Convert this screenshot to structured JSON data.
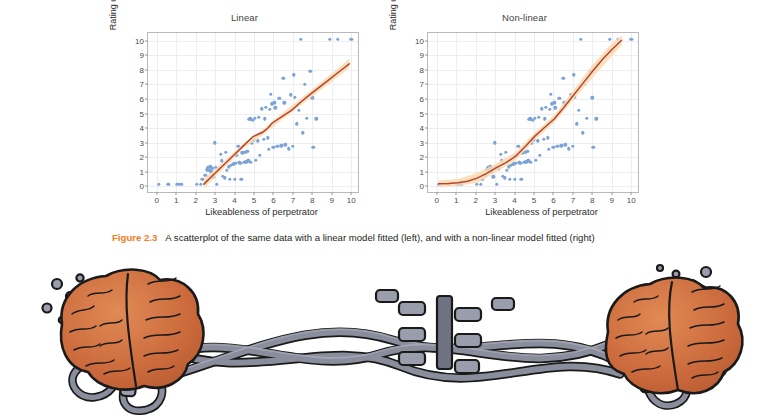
{
  "figure": {
    "number_label": "Figure 2.3",
    "caption": "A scatterplot of the same data with a linear model fitted (left), and with a non-linear model fitted (right)",
    "accent_color": "#f47b20"
  },
  "colors": {
    "point": "#7ba3d8",
    "fit_line": "#b5462a",
    "fit_band": "#fbd9b4",
    "grid": "#ededf2",
    "axis": "#b9b9b9",
    "text": "#2d2d2d",
    "brain": "#cc6b3d",
    "cable": "#8a8d9c",
    "outline": "#1a1a1a"
  },
  "chart_data": [
    {
      "type": "scatter",
      "title": "Linear",
      "xlabel": "Likeableness of perpetrator",
      "ylabel": "Rating of deed",
      "xlim": [
        -0.45,
        10.45
      ],
      "ylim": [
        -0.55,
        10.55
      ],
      "xticks": [
        0,
        1,
        2,
        3,
        4,
        5,
        6,
        7,
        8,
        9,
        10
      ],
      "yticks": [
        0,
        1,
        2,
        3,
        4,
        5,
        6,
        7,
        8,
        9,
        10
      ],
      "grid": true,
      "legend": "none",
      "fit_type": "linear",
      "fit_label": "linear model fitted",
      "fit_line": [
        [
          2.45,
          0.0
        ],
        [
          3.0,
          0.72
        ],
        [
          3.5,
          1.37
        ],
        [
          4.0,
          2.02
        ],
        [
          4.5,
          2.67
        ],
        [
          5.0,
          3.32
        ],
        [
          5.5,
          3.62
        ],
        [
          5.8,
          3.95
        ],
        [
          6.0,
          4.27
        ],
        [
          6.5,
          4.72
        ],
        [
          7.0,
          5.15
        ],
        [
          7.5,
          5.75
        ],
        [
          8.0,
          6.3
        ],
        [
          8.5,
          6.82
        ],
        [
          9.0,
          7.35
        ],
        [
          9.5,
          7.88
        ],
        [
          10.0,
          8.4
        ]
      ],
      "fit_band_upper": [
        [
          2.45,
          0.35
        ],
        [
          3.5,
          1.6
        ],
        [
          4.5,
          2.85
        ],
        [
          5.5,
          3.82
        ],
        [
          6.5,
          4.95
        ],
        [
          7.5,
          6.0
        ],
        [
          8.5,
          7.1
        ],
        [
          9.5,
          8.2
        ],
        [
          10.0,
          8.75
        ]
      ],
      "fit_band_lower": [
        [
          2.45,
          -0.3
        ],
        [
          3.5,
          1.12
        ],
        [
          4.5,
          2.5
        ],
        [
          5.5,
          3.42
        ],
        [
          6.5,
          4.5
        ],
        [
          7.5,
          5.52
        ],
        [
          8.5,
          6.55
        ],
        [
          9.5,
          7.58
        ],
        [
          10.0,
          8.1
        ]
      ],
      "points": [
        [
          0.1,
          0.0
        ],
        [
          0.6,
          0.0
        ],
        [
          1.05,
          0.0
        ],
        [
          1.2,
          0.0
        ],
        [
          1.3,
          0.0
        ],
        [
          2.05,
          0.0
        ],
        [
          2.25,
          0.0
        ],
        [
          2.35,
          0.35
        ],
        [
          2.5,
          0.6
        ],
        [
          2.6,
          1.0
        ],
        [
          2.62,
          1.15
        ],
        [
          2.7,
          0.95
        ],
        [
          2.75,
          1.2
        ],
        [
          2.8,
          0.85
        ],
        [
          2.85,
          1.1
        ],
        [
          2.9,
          0.5
        ],
        [
          3.0,
          2.85
        ],
        [
          3.05,
          1.15
        ],
        [
          3.1,
          0.0
        ],
        [
          3.2,
          1.05
        ],
        [
          3.3,
          2.05
        ],
        [
          3.35,
          1.6
        ],
        [
          3.4,
          0.55
        ],
        [
          3.5,
          0.45
        ],
        [
          3.55,
          2.2
        ],
        [
          3.6,
          0.95
        ],
        [
          3.7,
          1.2
        ],
        [
          3.75,
          0.35
        ],
        [
          3.8,
          1.3
        ],
        [
          3.9,
          1.35
        ],
        [
          3.95,
          1.4
        ],
        [
          4.0,
          0.35
        ],
        [
          4.05,
          1.45
        ],
        [
          4.1,
          2.0
        ],
        [
          4.2,
          2.6
        ],
        [
          4.25,
          1.5
        ],
        [
          4.3,
          1.42
        ],
        [
          4.35,
          0.35
        ],
        [
          4.4,
          2.15
        ],
        [
          4.5,
          1.5
        ],
        [
          4.55,
          2.2
        ],
        [
          4.6,
          1.55
        ],
        [
          4.65,
          2.25
        ],
        [
          4.7,
          1.6
        ],
        [
          4.75,
          4.45
        ],
        [
          4.8,
          4.5
        ],
        [
          4.85,
          1.5
        ],
        [
          4.9,
          2.8
        ],
        [
          4.95,
          4.4
        ],
        [
          5.0,
          3.05
        ],
        [
          5.05,
          4.55
        ],
        [
          5.1,
          1.65
        ],
        [
          5.2,
          3.0
        ],
        [
          5.25,
          4.6
        ],
        [
          5.3,
          2.0
        ],
        [
          5.4,
          5.2
        ],
        [
          5.5,
          3.1
        ],
        [
          5.55,
          4.5
        ],
        [
          5.6,
          5.3
        ],
        [
          5.7,
          3.2
        ],
        [
          5.75,
          2.4
        ],
        [
          5.8,
          5.15
        ],
        [
          5.85,
          6.2
        ],
        [
          5.9,
          5.55
        ],
        [
          6.0,
          2.55
        ],
        [
          6.05,
          5.6
        ],
        [
          6.1,
          5.25
        ],
        [
          6.2,
          2.6
        ],
        [
          6.3,
          5.9
        ],
        [
          6.4,
          2.65
        ],
        [
          6.5,
          7.3
        ],
        [
          6.55,
          5.6
        ],
        [
          6.6,
          2.7
        ],
        [
          6.8,
          2.45
        ],
        [
          6.9,
          6.15
        ],
        [
          7.0,
          2.6
        ],
        [
          7.05,
          7.55
        ],
        [
          7.1,
          6.0
        ],
        [
          7.2,
          4.15
        ],
        [
          7.3,
          5.1
        ],
        [
          7.4,
          10.0
        ],
        [
          7.5,
          3.55
        ],
        [
          7.6,
          6.9
        ],
        [
          7.7,
          4.55
        ],
        [
          7.9,
          7.8
        ],
        [
          8.0,
          5.95
        ],
        [
          8.05,
          2.55
        ],
        [
          8.2,
          4.5
        ],
        [
          8.9,
          10.0
        ],
        [
          9.3,
          10.0
        ],
        [
          10.0,
          10.0
        ]
      ]
    },
    {
      "type": "scatter",
      "title": "Non-linear",
      "xlabel": "Likeableness of perpetrator",
      "ylabel": "Rating of deed",
      "xlim": [
        -0.45,
        10.45
      ],
      "ylim": [
        -0.55,
        10.55
      ],
      "xticks": [
        0,
        1,
        2,
        3,
        4,
        5,
        6,
        7,
        8,
        9,
        10
      ],
      "yticks": [
        0,
        1,
        2,
        3,
        4,
        5,
        6,
        7,
        8,
        9,
        10
      ],
      "grid": true,
      "legend": "none",
      "fit_type": "loess",
      "fit_label": "non-linear model fitted",
      "fit_line": [
        [
          0.1,
          0.02
        ],
        [
          0.6,
          0.05
        ],
        [
          1.1,
          0.1
        ],
        [
          1.6,
          0.2
        ],
        [
          2.1,
          0.42
        ],
        [
          2.6,
          0.75
        ],
        [
          3.1,
          1.15
        ],
        [
          3.6,
          1.5
        ],
        [
          4.1,
          1.95
        ],
        [
          4.6,
          2.62
        ],
        [
          5.1,
          3.35
        ],
        [
          5.6,
          3.95
        ],
        [
          6.1,
          4.55
        ],
        [
          6.6,
          5.35
        ],
        [
          7.1,
          6.2
        ],
        [
          7.6,
          7.05
        ],
        [
          8.1,
          7.9
        ],
        [
          8.6,
          8.7
        ],
        [
          9.1,
          9.4
        ],
        [
          9.6,
          10.05
        ]
      ],
      "fit_band_upper": [
        [
          0.1,
          0.25
        ],
        [
          1.1,
          0.35
        ],
        [
          2.1,
          0.78
        ],
        [
          3.1,
          1.45
        ],
        [
          4.1,
          2.25
        ],
        [
          5.1,
          3.6
        ],
        [
          6.1,
          4.82
        ],
        [
          7.1,
          6.55
        ],
        [
          8.1,
          8.35
        ],
        [
          9.1,
          9.85
        ],
        [
          9.6,
          10.4
        ]
      ],
      "fit_band_lower": [
        [
          0.1,
          -0.2
        ],
        [
          1.1,
          -0.12
        ],
        [
          2.1,
          0.08
        ],
        [
          3.1,
          0.85
        ],
        [
          4.1,
          1.65
        ],
        [
          5.1,
          3.1
        ],
        [
          6.1,
          4.28
        ],
        [
          7.1,
          5.9
        ],
        [
          8.1,
          7.45
        ],
        [
          9.1,
          8.95
        ],
        [
          9.6,
          9.7
        ]
      ],
      "points": [
        [
          0.1,
          0.0
        ],
        [
          0.6,
          0.0
        ],
        [
          1.05,
          0.0
        ],
        [
          1.2,
          0.0
        ],
        [
          1.3,
          0.0
        ],
        [
          2.05,
          0.0
        ],
        [
          2.25,
          0.0
        ],
        [
          2.35,
          0.35
        ],
        [
          2.5,
          0.6
        ],
        [
          2.6,
          1.0
        ],
        [
          2.62,
          1.15
        ],
        [
          2.7,
          0.95
        ],
        [
          2.75,
          1.2
        ],
        [
          2.8,
          0.85
        ],
        [
          2.85,
          1.1
        ],
        [
          2.9,
          0.5
        ],
        [
          3.0,
          2.85
        ],
        [
          3.05,
          1.15
        ],
        [
          3.1,
          0.0
        ],
        [
          3.2,
          1.05
        ],
        [
          3.3,
          2.05
        ],
        [
          3.35,
          1.6
        ],
        [
          3.4,
          0.55
        ],
        [
          3.5,
          0.45
        ],
        [
          3.55,
          2.2
        ],
        [
          3.6,
          0.95
        ],
        [
          3.7,
          1.2
        ],
        [
          3.75,
          0.35
        ],
        [
          3.8,
          1.3
        ],
        [
          3.9,
          1.35
        ],
        [
          3.95,
          1.4
        ],
        [
          4.0,
          0.35
        ],
        [
          4.05,
          1.45
        ],
        [
          4.1,
          2.0
        ],
        [
          4.2,
          2.6
        ],
        [
          4.25,
          1.5
        ],
        [
          4.3,
          1.42
        ],
        [
          4.35,
          0.35
        ],
        [
          4.4,
          2.15
        ],
        [
          4.5,
          1.5
        ],
        [
          4.55,
          2.2
        ],
        [
          4.6,
          1.55
        ],
        [
          4.65,
          2.25
        ],
        [
          4.7,
          1.6
        ],
        [
          4.75,
          4.45
        ],
        [
          4.8,
          4.5
        ],
        [
          4.85,
          1.5
        ],
        [
          4.9,
          2.8
        ],
        [
          4.95,
          4.4
        ],
        [
          5.0,
          3.05
        ],
        [
          5.05,
          4.55
        ],
        [
          5.1,
          1.65
        ],
        [
          5.2,
          3.0
        ],
        [
          5.25,
          4.6
        ],
        [
          5.3,
          2.0
        ],
        [
          5.4,
          5.2
        ],
        [
          5.5,
          3.1
        ],
        [
          5.55,
          4.5
        ],
        [
          5.6,
          5.3
        ],
        [
          5.7,
          3.2
        ],
        [
          5.75,
          2.4
        ],
        [
          5.8,
          5.15
        ],
        [
          5.85,
          6.2
        ],
        [
          5.9,
          5.55
        ],
        [
          6.0,
          2.55
        ],
        [
          6.05,
          5.6
        ],
        [
          6.1,
          5.25
        ],
        [
          6.2,
          2.6
        ],
        [
          6.3,
          5.9
        ],
        [
          6.4,
          2.65
        ],
        [
          6.5,
          7.3
        ],
        [
          6.55,
          5.6
        ],
        [
          6.6,
          2.7
        ],
        [
          6.8,
          2.45
        ],
        [
          6.9,
          6.15
        ],
        [
          7.0,
          2.6
        ],
        [
          7.05,
          7.55
        ],
        [
          7.1,
          6.0
        ],
        [
          7.2,
          4.15
        ],
        [
          7.3,
          5.1
        ],
        [
          7.4,
          10.0
        ],
        [
          7.5,
          3.55
        ],
        [
          7.6,
          6.9
        ],
        [
          7.7,
          4.55
        ],
        [
          7.9,
          7.8
        ],
        [
          8.0,
          5.95
        ],
        [
          8.05,
          2.55
        ],
        [
          8.2,
          4.5
        ],
        [
          8.9,
          10.0
        ],
        [
          9.3,
          10.0
        ],
        [
          10.0,
          10.0
        ]
      ]
    }
  ],
  "illustration": {
    "name": "two-brains-connected-by-cables",
    "description": "Cartoon illustration of two orange brains linked by a bundle of grey cables with connectors"
  }
}
